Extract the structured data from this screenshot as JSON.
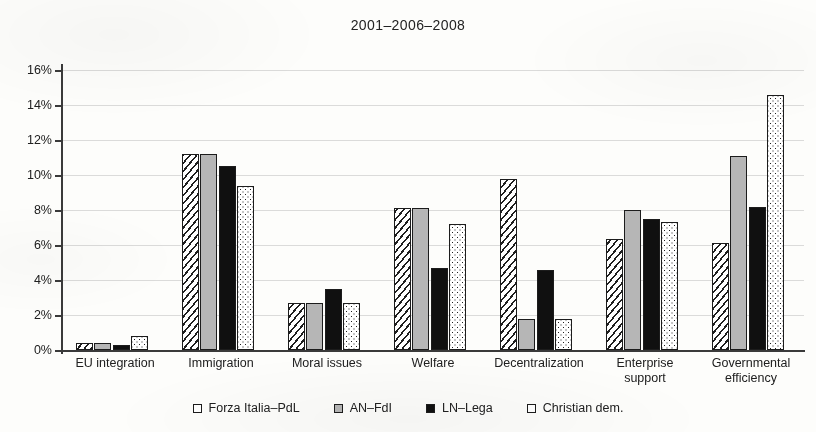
{
  "chart_data": {
    "type": "bar",
    "title": "2001–2006–2008",
    "xlabel": "",
    "ylabel": "",
    "ylim": [
      0,
      16
    ],
    "ytick_labels": [
      "0%",
      "2%",
      "4%",
      "6%",
      "8%",
      "10%",
      "12%",
      "14%",
      "16%"
    ],
    "ytick_values": [
      0,
      2,
      4,
      6,
      8,
      10,
      12,
      14,
      16
    ],
    "grid": true,
    "legend_position": "bottom",
    "categories": [
      "EU integration",
      "Immigration",
      "Moral issues",
      "Welfare",
      "Decentralization",
      "Enterprise\nsupport",
      "Governmental\nefficiency"
    ],
    "series": [
      {
        "name": "Forza Italia–PdL",
        "pattern": "diagonal-hatch",
        "values": [
          0.4,
          11.2,
          2.7,
          8.1,
          9.8,
          6.35,
          6.1
        ]
      },
      {
        "name": "AN–FdI",
        "pattern": "solid-grey",
        "values": [
          0.4,
          11.2,
          2.7,
          8.1,
          1.8,
          8.0,
          11.1
        ]
      },
      {
        "name": "LN–Lega",
        "pattern": "solid-black",
        "values": [
          0.3,
          10.5,
          3.5,
          4.7,
          4.6,
          7.5,
          8.2
        ]
      },
      {
        "name": "Christian dem.",
        "pattern": "dotted",
        "values": [
          0.8,
          9.4,
          2.7,
          7.2,
          1.8,
          7.3,
          14.6
        ]
      }
    ],
    "colors": {
      "series_0": "#ffffff",
      "series_1": "#b6b6b6",
      "series_2": "#101010",
      "series_3": "#ffffff",
      "axis": "#3a3a3a",
      "grid": "#cfcfcf",
      "background": "#fdfdfb",
      "text": "#202020"
    }
  }
}
